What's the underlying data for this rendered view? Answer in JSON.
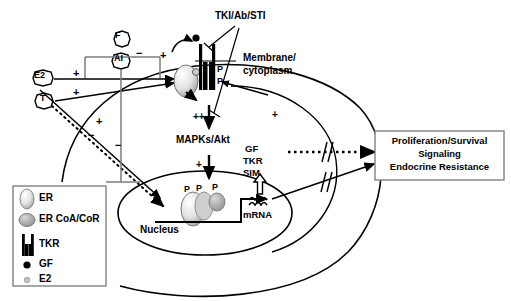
{
  "figure": {
    "type": "signaling-pathway-diagram",
    "background_color": "#ffffff",
    "line_color": "#000000",
    "accent_gray": "#b3b3b3"
  },
  "compartments": {
    "membrane_label_line1": "Membrane/",
    "membrane_label_line2": "cytoplasm",
    "nucleus_label": "Nucleus"
  },
  "ligands": [
    {
      "id": "F",
      "label": "F",
      "shape": "octagon"
    },
    {
      "id": "AI",
      "label": "AI",
      "shape": "octagon"
    },
    {
      "id": "E2",
      "label": "E2",
      "shape": "octagon"
    },
    {
      "id": "T",
      "label": "T",
      "shape": "octagon"
    }
  ],
  "inhibitors": {
    "tki_label": "TKI/Ab/STI"
  },
  "pathway_labels": {
    "mapks": "MAPKs/Akt",
    "gf": "GF",
    "tkr": "TKR",
    "sim": "SIM",
    "mrna": "mRNA"
  },
  "phospho_marks": {
    "symbol": "P",
    "membrane_receptor": [
      "P",
      "P"
    ],
    "nuclear_complex": [
      "P",
      "P",
      "P"
    ]
  },
  "signs": {
    "plus": "+",
    "plus_plus": "++",
    "minus": "−"
  },
  "sign_annotations": [
    {
      "name": "e2-to-receptor",
      "sign": "+"
    },
    {
      "name": "t-to-receptor",
      "sign": "+"
    },
    {
      "name": "t-to-nucleus",
      "sign": "+"
    },
    {
      "name": "t-inhibition",
      "sign": "−"
    },
    {
      "name": "gf-autocrine",
      "sign": "+"
    },
    {
      "name": "ai-inhibit-top",
      "sign": "−"
    },
    {
      "name": "ai-inhibit-bottom",
      "sign": "−"
    },
    {
      "name": "mapks-in",
      "sign": "++"
    },
    {
      "name": "mapks-out",
      "sign": "+"
    },
    {
      "name": "membrane-down",
      "sign": "++"
    }
  ],
  "outcome_box": {
    "line1": "Proliferation/Survival",
    "line2": "Signaling",
    "line3": "Endocrine Resistance",
    "border_color": "#808080"
  },
  "legend": {
    "border_color": "#808080",
    "items": [
      {
        "key": "er",
        "label": "ER",
        "glyph": "oval-outline"
      },
      {
        "key": "er-coa",
        "label": "ER CoA/CoR",
        "glyph": "filled-gray-oval"
      },
      {
        "key": "tkr",
        "label": "TKR",
        "glyph": "double-bar"
      },
      {
        "key": "gf",
        "label": "GF",
        "glyph": "black-dot"
      },
      {
        "key": "e2",
        "label": "E2",
        "glyph": "gray-dot"
      }
    ]
  }
}
